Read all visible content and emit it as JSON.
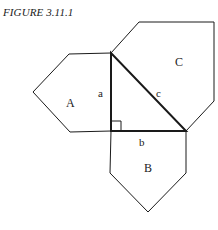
{
  "figure": {
    "caption": "FIGURE 3.11.1",
    "labels": {
      "A": "A",
      "B": "B",
      "C": "C",
      "a": "a",
      "b": "b",
      "c": "c"
    },
    "colors": {
      "stroke": "#1a1a1a",
      "background": "#ffffff"
    }
  }
}
